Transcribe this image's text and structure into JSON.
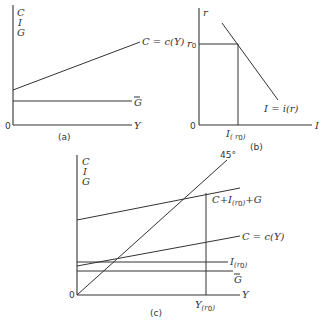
{
  "panels": {
    "a": {
      "label": "(a)",
      "y_axis_letters": [
        "C",
        "I",
        "G"
      ],
      "origin": "0",
      "x_axis": "Y",
      "curves": {
        "consumption": "C = c(Y)",
        "gov": "G"
      }
    },
    "b": {
      "label": "(b)",
      "y_axis": "r",
      "x_axis": "I",
      "origin": "0",
      "r0_label": "r",
      "r0_sub": "0",
      "i_tick_main": "I",
      "i_tick_sub": "( r",
      "i_tick_sub0": "0",
      "i_tick_close": ")",
      "curve": "I = i(r)"
    },
    "c": {
      "label": "(c)",
      "y_axis_letters": [
        "C",
        "I",
        "G"
      ],
      "origin": "0",
      "x_axis": "Y",
      "angle": "45°",
      "aggregate_a": "C+I",
      "aggregate_sub": "(r",
      "aggregate_sub0": "0",
      "aggregate_close": ")",
      "aggregate_b": "+G",
      "consumption": "C = c(Y)",
      "investment_main": "I",
      "investment_sub": "(r",
      "investment_sub0": "0",
      "investment_close": ")",
      "gov": "G",
      "equilibrium_main": "Y",
      "equilibrium_sub": "(r",
      "equilibrium_sub0": "0",
      "equilibrium_close": ")"
    }
  }
}
